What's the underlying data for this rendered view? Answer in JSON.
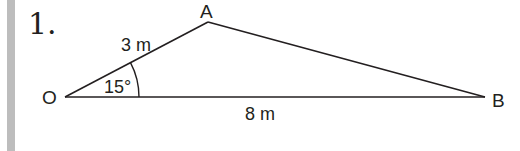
{
  "problem": {
    "number": "1."
  },
  "diagram": {
    "vertices": {
      "O": {
        "label": "O",
        "x": 65,
        "y": 97
      },
      "A": {
        "label": "A",
        "x": 208,
        "y": 22
      },
      "B": {
        "label": "B",
        "x": 485,
        "y": 97
      }
    },
    "sides": {
      "OA": {
        "label": "3 m"
      },
      "OB": {
        "label": "8 m"
      }
    },
    "angle": {
      "at": "O",
      "label": "15°"
    },
    "colors": {
      "stroke": "#231f20",
      "side_bar": "#bdbdbd"
    }
  }
}
